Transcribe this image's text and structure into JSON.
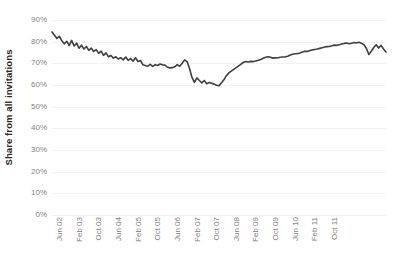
{
  "chart_data": {
    "type": "line",
    "title": "",
    "xlabel": "",
    "ylabel": "Share from all invitations",
    "ylim": [
      0,
      0.9
    ],
    "grid": true,
    "legend": "none",
    "y_tick_labels": [
      "90%",
      "80%",
      "70%",
      "60%",
      "50%",
      "40%",
      "30%",
      "20%",
      "10%",
      "0%"
    ],
    "y_tick_values": [
      90,
      80,
      70,
      60,
      50,
      40,
      30,
      20,
      10,
      0
    ],
    "x_tick_labels": [
      "Jun 02",
      "Feb 03",
      "Oct 03",
      "Jun 04",
      "Feb 05",
      "Oct 05",
      "Jun 06",
      "Feb 07",
      "Oct 07",
      "Jun 08",
      "Feb 09",
      "Oct 09",
      "Jun 10",
      "Feb 11",
      "Oct 11"
    ],
    "x_tick_index": [
      0,
      8,
      16,
      24,
      32,
      40,
      48,
      56,
      64,
      72,
      80,
      88,
      96,
      104,
      112
    ],
    "series": [
      {
        "name": "Share from all invitations",
        "color": "#3f3f3f",
        "x_start_label": "Jun 02",
        "x_end_label": "Mar 12",
        "values": [
          84.5,
          83.0,
          81.5,
          82.5,
          80.4,
          79.0,
          80.2,
          78.2,
          80.6,
          78.0,
          79.3,
          77.0,
          78.4,
          76.6,
          77.8,
          76.0,
          77.0,
          75.5,
          76.3,
          74.6,
          75.6,
          73.7,
          74.8,
          73.0,
          73.6,
          72.4,
          73.0,
          72.0,
          72.6,
          71.6,
          72.9,
          71.4,
          72.2,
          71.0,
          72.6,
          70.8,
          71.3,
          69.4,
          69.0,
          68.7,
          69.5,
          68.6,
          69.4,
          69.0,
          69.7,
          69.3,
          69.2,
          68.2,
          67.9,
          68.0,
          68.4,
          69.4,
          68.6,
          70.0,
          71.6,
          70.8,
          67.6,
          63.5,
          61.2,
          63.3,
          62.1,
          61.0,
          62.1,
          60.6,
          61.2,
          60.8,
          60.4,
          59.9,
          59.7,
          61.0,
          62.4,
          64.3,
          65.6,
          66.4,
          67.2,
          68.0,
          68.8,
          69.6,
          70.5,
          70.8,
          70.6,
          70.9,
          70.8,
          71.1,
          71.4,
          71.8,
          72.3,
          72.8,
          73.0,
          72.8,
          72.4,
          72.5,
          72.6,
          72.8,
          72.9,
          73.0,
          73.3,
          73.8,
          74.2,
          74.4,
          74.5,
          74.8,
          75.2,
          75.6,
          75.5,
          75.9,
          76.2,
          76.4,
          76.6,
          76.9,
          77.2,
          77.5,
          77.7,
          77.8,
          78.1,
          78.4,
          78.3,
          78.6,
          78.9,
          79.2,
          79.4,
          79.0,
          79.3,
          79.6,
          79.4,
          79.7,
          79.3,
          78.6,
          77.0,
          74.1,
          75.6,
          77.3,
          78.6,
          77.1,
          78.3,
          76.6,
          75.2
        ]
      }
    ]
  }
}
